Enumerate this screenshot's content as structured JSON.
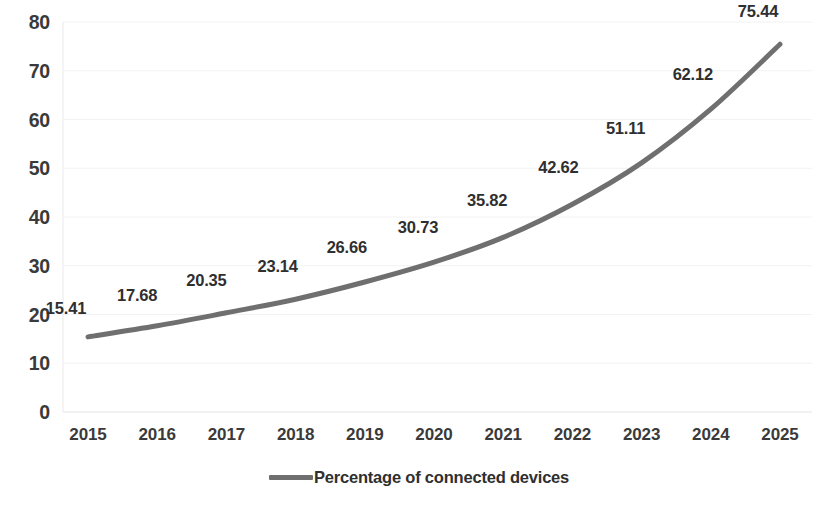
{
  "chart_data": {
    "type": "line",
    "title": "",
    "subtitle": "",
    "xlabel": "",
    "ylabel": "",
    "categories": [
      "2015",
      "2016",
      "2017",
      "2018",
      "2019",
      "2020",
      "2021",
      "2022",
      "2023",
      "2024",
      "2025"
    ],
    "series": [
      {
        "name": "Percentage of connected devices",
        "color": "#6f6f6f",
        "values": [
          15.41,
          17.68,
          20.35,
          23.14,
          26.66,
          30.73,
          35.82,
          42.62,
          51.11,
          62.12,
          75.44
        ]
      }
    ],
    "data_labels": [
      "15.41",
      "17.68",
      "20.35",
      "23.14",
      "26.66",
      "30.73",
      "35.82",
      "42.62",
      "51.11",
      "62.12",
      "75.44"
    ],
    "ylim": [
      0,
      80
    ],
    "yticks": [
      0,
      10,
      20,
      30,
      40,
      50,
      60,
      70,
      80
    ],
    "ytick_labels": [
      "0",
      "10",
      "20",
      "30",
      "40",
      "50",
      "60",
      "70",
      "80"
    ],
    "grid": true,
    "grid_color": "#f2f2f2",
    "legend_position": "bottom",
    "legend_entries": [
      "Percentage of connected devices"
    ],
    "smooth": true,
    "line_width": 5,
    "background": "#ffffff"
  }
}
